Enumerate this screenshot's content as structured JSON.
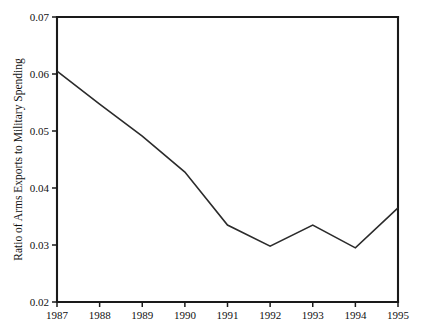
{
  "chart_data": {
    "type": "line",
    "title": "",
    "xlabel": "",
    "ylabel": "Ratio of Arms Exports to Military Spending",
    "categories": [
      "1987",
      "1988",
      "1989",
      "1990",
      "1991",
      "1992",
      "1993",
      "1994",
      "1995"
    ],
    "x": [
      1987,
      1988,
      1989,
      1990,
      1991,
      1992,
      1993,
      1994,
      1995
    ],
    "values": [
      0.0605,
      0.0547,
      0.0491,
      0.0428,
      0.0335,
      0.0298,
      0.0335,
      0.0295,
      0.0365
    ],
    "series": [
      {
        "name": "Ratio of Arms Exports to Military Spending",
        "values": [
          0.0605,
          0.0547,
          0.0491,
          0.0428,
          0.0335,
          0.0298,
          0.0335,
          0.0295,
          0.0365
        ]
      }
    ],
    "ylim": [
      0.02,
      0.07
    ],
    "xlim": [
      1987,
      1995
    ],
    "yticks": [
      0.02,
      0.03,
      0.04,
      0.05,
      0.06,
      0.07
    ],
    "ytick_labels": [
      "0.02",
      "0.03",
      "0.04",
      "0.05",
      "0.06",
      "0.07"
    ],
    "xticks": [
      1987,
      1988,
      1989,
      1990,
      1991,
      1992,
      1993,
      1994,
      1995
    ],
    "xtick_labels": [
      "1987",
      "1988",
      "1989",
      "1990",
      "1991",
      "1992",
      "1993",
      "1994",
      "1995"
    ],
    "grid": false,
    "legend": false,
    "legend_position": "none",
    "line_color": "#2b2b2b",
    "axis_color": "#1a1a1a",
    "background_color": "#ffffff"
  }
}
